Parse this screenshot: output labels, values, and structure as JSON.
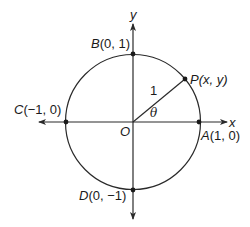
{
  "diagram": {
    "type": "unit-circle",
    "colors": {
      "background": "#ffffff",
      "stroke": "#2a2a2a",
      "text": "#1a1a1a"
    },
    "axes": {
      "x_label": "x",
      "y_label": "y",
      "origin_label": "O"
    },
    "circle": {
      "radius_label": "1",
      "angle_label": "θ"
    },
    "points": {
      "A": {
        "name": "A",
        "coords": "(1, 0)"
      },
      "B": {
        "name": "B",
        "coords": "(0, 1)"
      },
      "C": {
        "name": "C",
        "coords": "(−1, 0)"
      },
      "D": {
        "name": "D",
        "coords": "(0, −1)"
      },
      "P": {
        "name": "P",
        "coords": "(x, y)"
      }
    }
  }
}
